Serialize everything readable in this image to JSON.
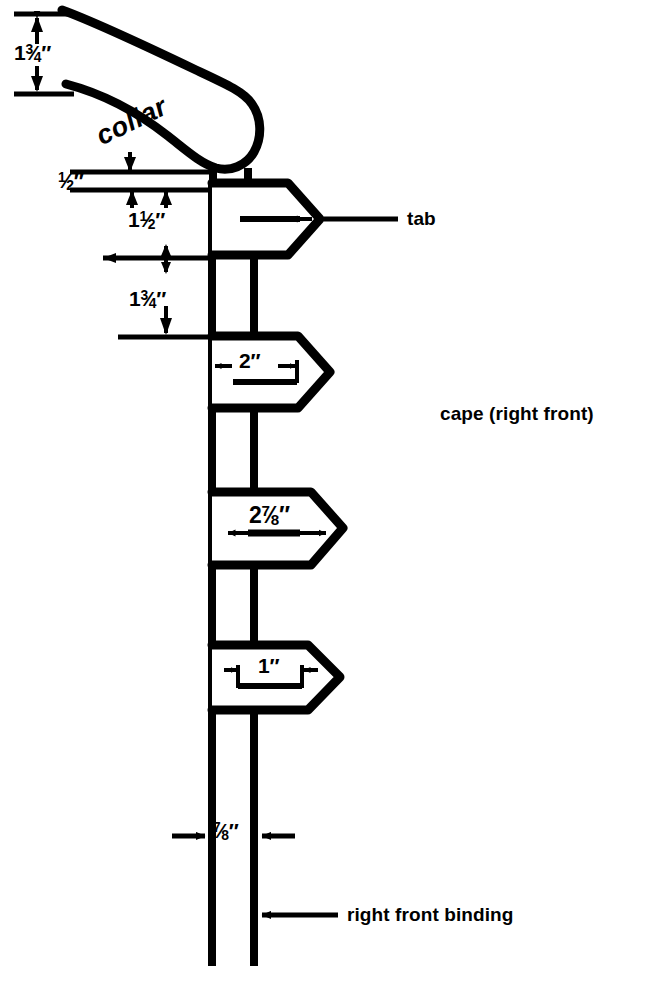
{
  "document": {
    "title": "cape and collar pattern diagram",
    "type": "technical sewing pattern diagram",
    "background_color": "#ffffff",
    "line_color": "#000000"
  },
  "labels": {
    "collar": "collar",
    "tab": "tab",
    "cape": "cape (right front)",
    "binding": "right front binding"
  },
  "dimensions": {
    "collar_depth": {
      "whole": "1",
      "num": "3",
      "den": "4",
      "unit": "″",
      "text": "1¾″"
    },
    "neck_gap": {
      "whole": "",
      "num": "1",
      "den": "2",
      "unit": "″",
      "text": "½″"
    },
    "tab_height_1": {
      "whole": "1",
      "num": "1",
      "den": "2",
      "unit": "″",
      "text": "1½″"
    },
    "tab_spacing": {
      "whole": "1",
      "num": "3",
      "den": "4",
      "unit": "″",
      "text": "1¾″"
    },
    "tab_width_2": {
      "whole": "2",
      "num": "",
      "den": "",
      "unit": "″",
      "text": "2″"
    },
    "tab_width_3": {
      "whole": "2",
      "num": "7",
      "den": "8",
      "unit": "″",
      "text": "2⅞″"
    },
    "tab_width_4": {
      "whole": "1",
      "num": "",
      "den": "",
      "unit": "″",
      "text": "1″"
    },
    "binding_width": {
      "whole": "",
      "num": "7",
      "den": "8",
      "unit": "″",
      "text": "⅞″"
    }
  },
  "parts": [
    {
      "name": "collar",
      "label": "collar"
    },
    {
      "name": "tab-1",
      "label": "tab"
    },
    {
      "name": "tab-2",
      "label": ""
    },
    {
      "name": "tab-3",
      "label": ""
    },
    {
      "name": "tab-4",
      "label": ""
    },
    {
      "name": "right-front-binding",
      "label": "right front binding"
    }
  ]
}
